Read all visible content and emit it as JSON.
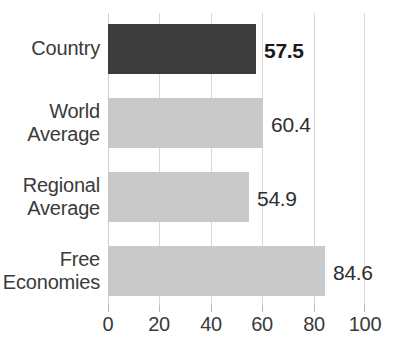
{
  "chart_data": {
    "type": "bar",
    "orientation": "horizontal",
    "title": "",
    "subtitle": "",
    "xlabel": "",
    "ylabel": "",
    "categories": [
      "Country",
      "World Average",
      "Regional Average",
      "Free Economies"
    ],
    "values": [
      57.5,
      54.9,
      60.4,
      84.6
    ],
    "series": [
      {
        "name": "Score",
        "points": [
          {
            "category": "Country",
            "value": 57.5,
            "label": "57.5",
            "emphasis": true,
            "color": "#3c3c3c"
          },
          {
            "category": "World Average",
            "value": 60.4,
            "label": "60.4",
            "emphasis": false,
            "color": "#c9c9c9"
          },
          {
            "category": "Regional Average",
            "value": 54.9,
            "label": "54.9",
            "emphasis": false,
            "color": "#c9c9c9"
          },
          {
            "category": "Free Economies",
            "value": 84.6,
            "label": "84.6",
            "emphasis": false,
            "color": "#c9c9c9"
          }
        ]
      }
    ],
    "xlim": [
      0,
      100
    ],
    "xticks": [
      0,
      20,
      40,
      60,
      80,
      100
    ],
    "xtick_labels": [
      "0",
      "20",
      "40",
      "60",
      "80",
      "100"
    ],
    "grid": true,
    "grid_axis": "x",
    "legend": false,
    "legend_position": "none",
    "colors": {
      "highlight_bar": "#3c3c3c",
      "default_bar": "#c9c9c9",
      "gridline": "#d8d8d8",
      "text": "#3a3a3a",
      "background": "#ffffff"
    }
  },
  "category_label_lines": [
    [
      "Country"
    ],
    [
      "World",
      "Average"
    ],
    [
      "Regional",
      "Average"
    ],
    [
      "Free",
      "Economies"
    ]
  ]
}
